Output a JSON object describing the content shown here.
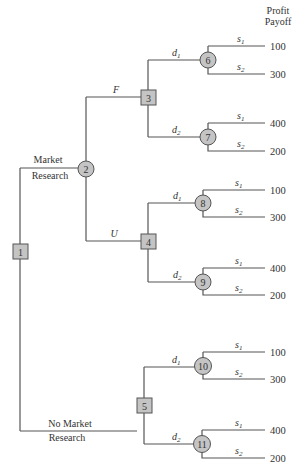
{
  "header": {
    "line1": "Profit",
    "line2": "Payoff"
  },
  "branches": {
    "market_research_1": "Market",
    "market_research_2": "Research",
    "no_market_research_1": "No Market",
    "no_market_research_2": "Research",
    "favorable": "F",
    "unfavorable": "U",
    "d": "d",
    "s": "s",
    "sub1": "1",
    "sub2": "2"
  },
  "nodes": {
    "n1": "1",
    "n2": "2",
    "n3": "3",
    "n4": "4",
    "n5": "5",
    "n6": "6",
    "n7": "7",
    "n8": "8",
    "n9": "9",
    "n10": "10",
    "n11": "11"
  },
  "payoffs": {
    "n6_s1": "100",
    "n6_s2": "300",
    "n7_s1": "400",
    "n7_s2": "200",
    "n8_s1": "100",
    "n8_s2": "300",
    "n9_s1": "400",
    "n9_s2": "200",
    "n10_s1": "100",
    "n10_s2": "300",
    "n11_s1": "400",
    "n11_s2": "200"
  },
  "colors": {
    "node_fill": "#c4c4c4",
    "line": "#555555"
  }
}
